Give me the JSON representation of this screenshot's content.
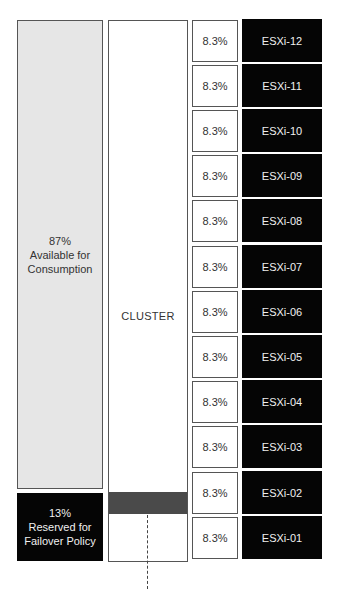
{
  "left_column": {
    "available": {
      "percent": "87%",
      "line1": "Available for",
      "line2": "Consumption",
      "color": "#e6e6e6"
    },
    "reserved": {
      "percent": "13%",
      "line1": "Reserved for",
      "line2": "Failover Policy",
      "color": "#050505"
    }
  },
  "cluster": {
    "label": "CLUSTER",
    "reserved_bar_color": "#4a4a4a"
  },
  "hosts": [
    {
      "name": "ESXi-12",
      "share": "8.3%"
    },
    {
      "name": "ESXi-11",
      "share": "8.3%"
    },
    {
      "name": "ESXi-10",
      "share": "8.3%"
    },
    {
      "name": "ESXi-09",
      "share": "8.3%"
    },
    {
      "name": "ESXi-08",
      "share": "8.3%"
    },
    {
      "name": "ESXi-07",
      "share": "8.3%"
    },
    {
      "name": "ESXi-06",
      "share": "8.3%"
    },
    {
      "name": "ESXi-05",
      "share": "8.3%"
    },
    {
      "name": "ESXi-04",
      "share": "8.3%"
    },
    {
      "name": "ESXi-03",
      "share": "8.3%"
    },
    {
      "name": "ESXi-02",
      "share": "8.3%"
    },
    {
      "name": "ESXi-01",
      "share": "8.3%"
    }
  ]
}
